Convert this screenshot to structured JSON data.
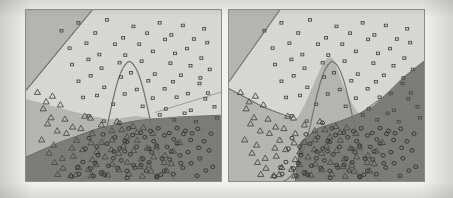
{
  "figure": {
    "title": "",
    "caption": "",
    "background_color": "#f2f2f0",
    "panel_border_color": "#8d8d8a"
  },
  "chart_data": {
    "type": "scatter",
    "title": "",
    "subtitle": "",
    "xlabel": "",
    "ylabel": "",
    "xlim": [
      0,
      100
    ],
    "ylim": [
      0,
      100
    ],
    "grid": false,
    "legend": "none",
    "axis_ticks_visible": false,
    "panels": [
      {
        "name": "left-panel",
        "label": "",
        "regions": [
          {
            "class": "square",
            "fill": "#d8d8d5",
            "note": "large light region occupying top and right of panel"
          },
          {
            "class": "triangle",
            "fill": "#b5b5b1",
            "note": "mid-gray band across lower-middle and upper-left corner"
          },
          {
            "class": "circle",
            "fill": "#7b7b78",
            "note": "dark region filling the lower-right two thirds"
          }
        ],
        "boundary_contour": {
          "shape": "bell-curve",
          "stroke": "#6b6b68",
          "note": "parabolic peak near panel centre"
        }
      },
      {
        "name": "right-panel",
        "label": "",
        "regions": [
          {
            "class": "square",
            "fill": "#d8d8d5",
            "note": "light region across top and right"
          },
          {
            "class": "triangle",
            "fill": "#b5b5b1",
            "note": "mid-gray wedge under the bell peak and along the left edge"
          },
          {
            "class": "circle",
            "fill": "#7b7b78",
            "note": "dark region at lower-right with curved upper edge"
          }
        ],
        "boundary_contour": {
          "shape": "bell-curve",
          "stroke": "#6b6b68",
          "note": "parabolic peak near panel centre, region filled beneath it"
        }
      }
    ],
    "series": [
      {
        "name": "class-square",
        "marker": "square",
        "color": "#4a4a48",
        "count": 64,
        "points": [
          [
            18,
            88
          ],
          [
            27,
            92
          ],
          [
            35,
            86
          ],
          [
            42,
            94
          ],
          [
            49,
            83
          ],
          [
            55,
            91
          ],
          [
            61,
            87
          ],
          [
            68,
            93
          ],
          [
            74,
            85
          ],
          [
            80,
            90
          ],
          [
            86,
            84
          ],
          [
            92,
            89
          ],
          [
            22,
            78
          ],
          [
            30,
            81
          ],
          [
            37,
            75
          ],
          [
            45,
            79
          ],
          [
            52,
            73
          ],
          [
            58,
            80
          ],
          [
            64,
            76
          ],
          [
            71,
            82
          ],
          [
            77,
            74
          ],
          [
            83,
            78
          ],
          [
            89,
            72
          ],
          [
            94,
            80
          ],
          [
            24,
            68
          ],
          [
            31,
            71
          ],
          [
            39,
            65
          ],
          [
            47,
            70
          ],
          [
            54,
            64
          ],
          [
            60,
            69
          ],
          [
            67,
            63
          ],
          [
            73,
            68
          ],
          [
            79,
            62
          ],
          [
            85,
            67
          ],
          [
            90,
            61
          ],
          [
            95,
            66
          ],
          [
            26,
            58
          ],
          [
            34,
            61
          ],
          [
            41,
            55
          ],
          [
            48,
            60
          ],
          [
            56,
            54
          ],
          [
            63,
            59
          ],
          [
            70,
            53
          ],
          [
            76,
            58
          ],
          [
            82,
            52
          ],
          [
            88,
            57
          ],
          [
            93,
            51
          ],
          [
            29,
            48
          ],
          [
            36,
            51
          ],
          [
            44,
            45
          ],
          [
            51,
            50
          ],
          [
            59,
            44
          ],
          [
            66,
            49
          ],
          [
            72,
            43
          ],
          [
            78,
            48
          ],
          [
            84,
            42
          ],
          [
            91,
            47
          ],
          [
            96,
            44
          ],
          [
            32,
            39
          ],
          [
            40,
            36
          ],
          [
            69,
            38
          ],
          [
            75,
            35
          ],
          [
            81,
            39
          ],
          [
            87,
            34
          ],
          [
            97,
            37
          ]
        ]
      },
      {
        "name": "class-triangle",
        "marker": "triangle",
        "color": "#4a4a48",
        "count": 72,
        "points": [
          [
            6,
            52
          ],
          [
            10,
            47
          ],
          [
            14,
            50
          ],
          [
            8,
            42
          ],
          [
            13,
            38
          ],
          [
            18,
            44
          ],
          [
            11,
            33
          ],
          [
            16,
            29
          ],
          [
            21,
            36
          ],
          [
            9,
            25
          ],
          [
            15,
            21
          ],
          [
            20,
            27
          ],
          [
            24,
            32
          ],
          [
            12,
            17
          ],
          [
            18,
            14
          ],
          [
            23,
            20
          ],
          [
            27,
            25
          ],
          [
            29,
            30
          ],
          [
            14,
            10
          ],
          [
            20,
            8
          ],
          [
            25,
            14
          ],
          [
            30,
            18
          ],
          [
            33,
            23
          ],
          [
            35,
            28
          ],
          [
            17,
            5
          ],
          [
            23,
            4
          ],
          [
            28,
            9
          ],
          [
            33,
            13
          ],
          [
            36,
            17
          ],
          [
            39,
            22
          ],
          [
            26,
            3
          ],
          [
            31,
            6
          ],
          [
            37,
            10
          ],
          [
            40,
            15
          ],
          [
            43,
            19
          ],
          [
            45,
            24
          ],
          [
            34,
            4
          ],
          [
            39,
            5
          ],
          [
            44,
            11
          ],
          [
            47,
            16
          ],
          [
            49,
            21
          ],
          [
            51,
            26
          ],
          [
            42,
            3
          ],
          [
            48,
            7
          ],
          [
            53,
            12
          ],
          [
            55,
            18
          ],
          [
            57,
            23
          ],
          [
            52,
            4
          ],
          [
            58,
            8
          ],
          [
            60,
            14
          ],
          [
            62,
            19
          ],
          [
            59,
            4
          ],
          [
            64,
            9
          ],
          [
            66,
            15
          ],
          [
            68,
            21
          ],
          [
            65,
            5
          ],
          [
            70,
            10
          ],
          [
            72,
            16
          ],
          [
            71,
            5
          ],
          [
            74,
            11
          ],
          [
            76,
            17
          ],
          [
            78,
            22
          ],
          [
            43,
            30
          ],
          [
            47,
            34
          ],
          [
            50,
            30
          ],
          [
            54,
            33
          ],
          [
            57,
            29
          ],
          [
            61,
            32
          ],
          [
            64,
            28
          ],
          [
            38,
            33
          ],
          [
            34,
            36
          ],
          [
            30,
            38
          ]
        ]
      },
      {
        "name": "class-circle",
        "marker": "circle",
        "color": "#2e2e2c",
        "count": 78,
        "points": [
          [
            40,
            28
          ],
          [
            45,
            26
          ],
          [
            50,
            24
          ],
          [
            55,
            27
          ],
          [
            60,
            25
          ],
          [
            65,
            23
          ],
          [
            70,
            26
          ],
          [
            75,
            24
          ],
          [
            42,
            21
          ],
          [
            47,
            19
          ],
          [
            52,
            22
          ],
          [
            57,
            20
          ],
          [
            62,
            18
          ],
          [
            67,
            21
          ],
          [
            72,
            19
          ],
          [
            77,
            22
          ],
          [
            44,
            14
          ],
          [
            49,
            12
          ],
          [
            54,
            15
          ],
          [
            59,
            13
          ],
          [
            64,
            11
          ],
          [
            69,
            14
          ],
          [
            74,
            12
          ],
          [
            79,
            15
          ],
          [
            46,
            7
          ],
          [
            51,
            5
          ],
          [
            56,
            8
          ],
          [
            61,
            6
          ],
          [
            66,
            4
          ],
          [
            71,
            7
          ],
          [
            76,
            5
          ],
          [
            81,
            8
          ],
          [
            38,
            16
          ],
          [
            36,
            10
          ],
          [
            41,
            4
          ],
          [
            83,
            18
          ],
          [
            85,
            11
          ],
          [
            87,
            4
          ],
          [
            80,
            28
          ],
          [
            84,
            25
          ],
          [
            33,
            8
          ],
          [
            35,
            3
          ],
          [
            58,
            29
          ],
          [
            53,
            31
          ],
          [
            48,
            33
          ],
          [
            63,
            30
          ],
          [
            68,
            31
          ],
          [
            73,
            29
          ],
          [
            78,
            32
          ],
          [
            82,
            30
          ],
          [
            86,
            27
          ],
          [
            88,
            20
          ],
          [
            90,
            13
          ],
          [
            92,
            6
          ],
          [
            30,
            12
          ],
          [
            28,
            5
          ],
          [
            43,
            9
          ],
          [
            39,
            6
          ],
          [
            45,
            17
          ],
          [
            50,
            18
          ],
          [
            55,
            10
          ],
          [
            60,
            9
          ],
          [
            65,
            16
          ],
          [
            70,
            4
          ],
          [
            75,
            17
          ],
          [
            80,
            10
          ],
          [
            31,
            18
          ],
          [
            26,
            9
          ],
          [
            24,
            3
          ],
          [
            89,
            31
          ],
          [
            91,
            24
          ],
          [
            93,
            17
          ],
          [
            95,
            9
          ],
          [
            94,
            28
          ],
          [
            52,
            2
          ],
          [
            67,
            2
          ],
          [
            37,
            21
          ],
          [
            32,
            24
          ]
        ]
      }
    ]
  }
}
